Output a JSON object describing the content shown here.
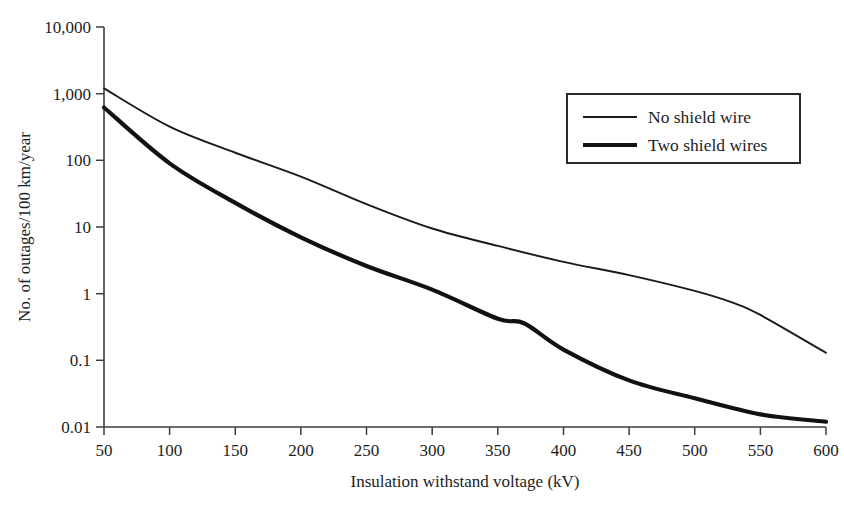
{
  "chart_data": {
    "type": "line",
    "title": "",
    "xlabel": "Insulation withstand voltage (kV)",
    "ylabel": "No. of outages/100 km/year",
    "xlim": [
      50,
      600
    ],
    "ylim": [
      0.01,
      10000
    ],
    "yscale": "log",
    "xscale": "linear",
    "grid": false,
    "legend_position": "upper right",
    "xticks": [
      50,
      100,
      150,
      200,
      250,
      300,
      350,
      400,
      450,
      500,
      550,
      600
    ],
    "xtick_labels": [
      "50",
      "100",
      "150",
      "200",
      "250",
      "300",
      "350",
      "400",
      "450",
      "500",
      "550",
      "600"
    ],
    "yticks": [
      0.01,
      0.1,
      1,
      10,
      100,
      1000,
      10000
    ],
    "ytick_labels": [
      "0.01",
      "0.1",
      "1",
      "10",
      "100",
      "1,000",
      "10,000"
    ],
    "series": [
      {
        "name": "No shield wire",
        "line_style": "thin",
        "color": "#1a1a1a",
        "x": [
          50,
          100,
          150,
          200,
          250,
          300,
          350,
          400,
          450,
          500,
          530,
          550,
          600
        ],
        "values": [
          1200,
          320,
          130,
          57,
          22,
          9.5,
          5.2,
          3.0,
          1.9,
          1.1,
          0.72,
          0.48,
          0.13
        ]
      },
      {
        "name": "Two shield wires",
        "line_style": "thick",
        "color": "#111111",
        "x": [
          50,
          100,
          150,
          200,
          250,
          300,
          350,
          370,
          400,
          450,
          500,
          550,
          600
        ],
        "values": [
          620,
          90,
          23,
          7.0,
          2.6,
          1.15,
          0.42,
          0.36,
          0.145,
          0.05,
          0.027,
          0.0155,
          0.012
        ]
      }
    ]
  },
  "legend": {
    "entries": [
      {
        "label": "No shield wire"
      },
      {
        "label": "Two shield wires"
      }
    ]
  },
  "axes": {
    "y_title": "No. of outages/100 km/year",
    "x_title": "Insulation withstand voltage (kV)"
  }
}
